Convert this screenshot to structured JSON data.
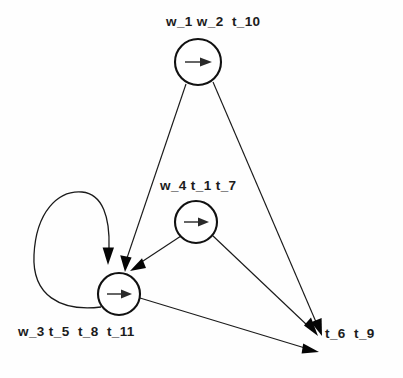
{
  "diagram": {
    "background_color": "#fefefe",
    "stroke_color": "#111111",
    "nodes": [
      {
        "id": "top",
        "label": "w_1 w_2  t_10",
        "glyph": "right-arrow-glyph",
        "cx": 198,
        "cy": 62,
        "r": 23
      },
      {
        "id": "middle",
        "label": "w_4 t_1 t_7",
        "glyph": "right-arrow-glyph",
        "cx": 196,
        "cy": 222,
        "r": 21
      },
      {
        "id": "bottom-left",
        "label": "w_3 t_5  t_8  t_11",
        "glyph": "right-arrow-glyph",
        "cx": 119,
        "cy": 294,
        "r": 21
      }
    ],
    "sink": {
      "id": "bottom-right",
      "label": "t_6  t_9",
      "x": 322,
      "y": 340
    },
    "edges": [
      {
        "from": "top",
        "to": "bottom-left"
      },
      {
        "from": "top",
        "to": "bottom-right"
      },
      {
        "from": "middle",
        "to": "bottom-left"
      },
      {
        "from": "middle",
        "to": "bottom-right"
      },
      {
        "from": "bottom-left",
        "to": "bottom-right"
      },
      {
        "from": "bottom-left",
        "to": "bottom-left"
      }
    ]
  }
}
